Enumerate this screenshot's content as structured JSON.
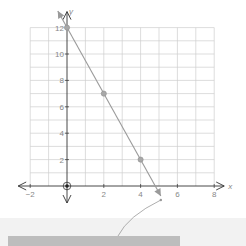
{
  "chart_data": {
    "type": "line",
    "title": "",
    "xlabel": "x",
    "ylabel": "y",
    "xlim": [
      -2,
      8
    ],
    "ylim": [
      0,
      12
    ],
    "grid": true,
    "x_ticks": [
      -2,
      2,
      4,
      6,
      8
    ],
    "x_tick_labels": [
      "−2",
      "2",
      "4",
      "6",
      "8"
    ],
    "y_ticks": [
      2,
      4,
      6,
      8,
      10,
      12
    ],
    "y_tick_labels": [
      "2",
      "4",
      "6",
      "8",
      "10",
      "12"
    ],
    "series": [
      {
        "name": "line",
        "points": [
          [
            0,
            12
          ],
          [
            2,
            7
          ],
          [
            4,
            2
          ]
        ],
        "extends_to": [
          [
            -0.5,
            13.25
          ],
          [
            5.1,
            -0.75
          ]
        ],
        "color": "#9a9a9a"
      }
    ],
    "selected_point": [
      0,
      0
    ],
    "colors": {
      "axis": "#333333",
      "grid": "#cfcfcf",
      "point": "#a8a8a8",
      "line": "#9a9a9a"
    }
  }
}
